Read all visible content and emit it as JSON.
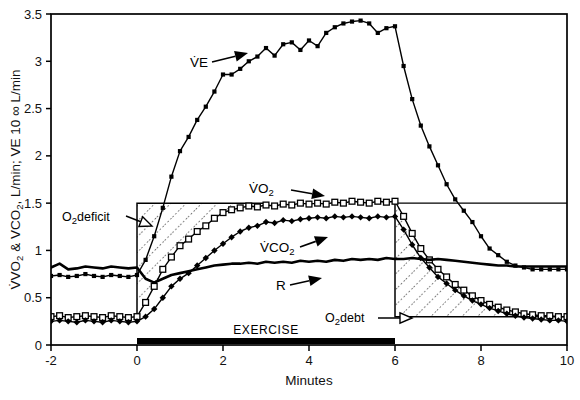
{
  "figure": {
    "yaxis_label_parts": {
      "p1": "VO",
      "p1sub": "2",
      "p2": " & VCO",
      "p2sub": "2",
      "p3": ", L/min; VE 10 ∞ L/min"
    },
    "yaxis_label": "VO2 & VCO2, L/min; VE 10 ∞ L/min",
    "xaxis_label": "Minutes",
    "exercise_bar_label": "EXERCISE"
  },
  "annotations": {
    "o2deficit": {
      "main": "O",
      "sub": "2",
      "tail": "deficit"
    },
    "o2debt": {
      "main": "O",
      "sub": "2",
      "tail": "debt"
    }
  },
  "series_labels": {
    "ve": "VE",
    "vo2": {
      "main": "VO",
      "sub": "2"
    },
    "vco2": {
      "main": "VCO",
      "sub": "2"
    },
    "r": "R"
  },
  "colors": {
    "ink": "#000000",
    "background": "#ffffff",
    "exercise_bar": "#000000"
  },
  "chart_data": {
    "type": "line",
    "title": "",
    "xlabel": "Minutes",
    "ylabel": "VO2 & VCO2, L/min; VE 10 ∞ L/min",
    "xlim": [
      -2,
      10
    ],
    "ylim": [
      0,
      3.5
    ],
    "xticks": [
      -2,
      0,
      2,
      4,
      6,
      8,
      10
    ],
    "yticks": [
      0,
      0.5,
      1,
      1.5,
      2,
      2.5,
      3,
      3.5
    ],
    "grid": false,
    "legend": "inline-annotations",
    "exercise_period": [
      0,
      6
    ],
    "shaded_regions": [
      {
        "name": "O2 deficit",
        "x": [
          0,
          3.0
        ],
        "y": [
          0.3,
          1.5
        ],
        "hatch": "dotted-diagonal",
        "description": "Area between the VO2 steady-state level (1.5) and the rising VO2 curve during the first ~3 minutes of exercise"
      },
      {
        "name": "O2 debt",
        "x": [
          6,
          10
        ],
        "y": [
          0.3,
          1.5
        ],
        "hatch": "dotted-diagonal",
        "description": "Area between the decaying VO2 curve after exercise and the resting baseline (0.3)"
      }
    ],
    "series": [
      {
        "name": "VE",
        "marker": "filled-square",
        "x": [
          -2.0,
          -1.8,
          -1.6,
          -1.4,
          -1.2,
          -1.0,
          -0.8,
          -0.6,
          -0.4,
          -0.2,
          0.0,
          0.2,
          0.4,
          0.6,
          0.8,
          1.0,
          1.2,
          1.4,
          1.6,
          1.8,
          2.0,
          2.2,
          2.4,
          2.6,
          2.8,
          3.0,
          3.2,
          3.4,
          3.6,
          3.8,
          4.0,
          4.2,
          4.4,
          4.6,
          4.8,
          5.0,
          5.2,
          5.4,
          5.6,
          5.8,
          6.0,
          6.2,
          6.4,
          6.6,
          6.8,
          7.0,
          7.2,
          7.4,
          7.6,
          7.8,
          8.0,
          8.2,
          8.4,
          8.6,
          8.8,
          9.0,
          9.2,
          9.4,
          9.6,
          9.8,
          10.0
        ],
        "y": [
          0.73,
          0.74,
          0.72,
          0.73,
          0.75,
          0.73,
          0.72,
          0.74,
          0.73,
          0.72,
          0.74,
          0.9,
          1.15,
          1.45,
          1.78,
          2.05,
          2.2,
          2.38,
          2.52,
          2.68,
          2.86,
          2.86,
          2.92,
          3.0,
          3.05,
          3.14,
          3.06,
          3.18,
          3.2,
          3.12,
          3.22,
          3.16,
          3.3,
          3.36,
          3.4,
          3.42,
          3.43,
          3.4,
          3.3,
          3.35,
          3.37,
          2.95,
          2.6,
          2.32,
          2.1,
          1.9,
          1.7,
          1.54,
          1.42,
          1.3,
          1.15,
          1.02,
          0.95,
          0.88,
          0.84,
          0.82,
          0.8,
          0.8,
          0.8,
          0.8,
          0.8
        ]
      },
      {
        "name": "VO2",
        "marker": "open-square",
        "x": [
          -2.0,
          -1.8,
          -1.6,
          -1.4,
          -1.2,
          -1.0,
          -0.8,
          -0.6,
          -0.4,
          -0.2,
          0.0,
          0.2,
          0.4,
          0.6,
          0.8,
          1.0,
          1.2,
          1.4,
          1.6,
          1.8,
          2.0,
          2.2,
          2.4,
          2.6,
          2.8,
          3.0,
          3.2,
          3.4,
          3.6,
          3.8,
          4.0,
          4.2,
          4.4,
          4.6,
          4.8,
          5.0,
          5.2,
          5.4,
          5.6,
          5.8,
          6.0,
          6.2,
          6.4,
          6.6,
          6.8,
          7.0,
          7.2,
          7.4,
          7.6,
          7.8,
          8.0,
          8.2,
          8.4,
          8.6,
          8.8,
          9.0,
          9.2,
          9.4,
          9.6,
          9.8,
          10.0
        ],
        "y": [
          0.3,
          0.31,
          0.29,
          0.3,
          0.31,
          0.3,
          0.29,
          0.31,
          0.3,
          0.29,
          0.3,
          0.45,
          0.62,
          0.8,
          0.93,
          1.05,
          1.12,
          1.2,
          1.26,
          1.34,
          1.4,
          1.43,
          1.45,
          1.47,
          1.46,
          1.48,
          1.47,
          1.49,
          1.48,
          1.5,
          1.49,
          1.5,
          1.49,
          1.51,
          1.5,
          1.52,
          1.51,
          1.5,
          1.52,
          1.51,
          1.52,
          1.36,
          1.18,
          1.02,
          0.9,
          0.8,
          0.72,
          0.64,
          0.58,
          0.52,
          0.47,
          0.43,
          0.4,
          0.37,
          0.35,
          0.33,
          0.32,
          0.31,
          0.31,
          0.3,
          0.3
        ]
      },
      {
        "name": "VCO2",
        "marker": "filled-diamond",
        "x": [
          -2.0,
          -1.8,
          -1.6,
          -1.4,
          -1.2,
          -1.0,
          -0.8,
          -0.6,
          -0.4,
          -0.2,
          0.0,
          0.2,
          0.4,
          0.6,
          0.8,
          1.0,
          1.2,
          1.4,
          1.6,
          1.8,
          2.0,
          2.2,
          2.4,
          2.6,
          2.8,
          3.0,
          3.2,
          3.4,
          3.6,
          3.8,
          4.0,
          4.2,
          4.4,
          4.6,
          4.8,
          5.0,
          5.2,
          5.4,
          5.6,
          5.8,
          6.0,
          6.2,
          6.4,
          6.6,
          6.8,
          7.0,
          7.2,
          7.4,
          7.6,
          7.8,
          8.0,
          8.2,
          8.4,
          8.6,
          8.8,
          9.0,
          9.2,
          9.4,
          9.6,
          9.8,
          10.0
        ],
        "y": [
          0.25,
          0.26,
          0.25,
          0.24,
          0.26,
          0.25,
          0.24,
          0.26,
          0.25,
          0.24,
          0.25,
          0.3,
          0.38,
          0.5,
          0.62,
          0.7,
          0.76,
          0.84,
          0.92,
          1.0,
          1.07,
          1.14,
          1.2,
          1.24,
          1.26,
          1.3,
          1.29,
          1.32,
          1.31,
          1.33,
          1.34,
          1.35,
          1.34,
          1.36,
          1.35,
          1.36,
          1.35,
          1.34,
          1.36,
          1.35,
          1.36,
          1.22,
          1.06,
          0.92,
          0.82,
          0.72,
          0.65,
          0.58,
          0.52,
          0.47,
          0.43,
          0.39,
          0.36,
          0.33,
          0.31,
          0.29,
          0.28,
          0.27,
          0.26,
          0.26,
          0.25
        ]
      },
      {
        "name": "R",
        "marker": "none",
        "x": [
          -2.0,
          -1.8,
          -1.6,
          -1.4,
          -1.2,
          -1.0,
          -0.8,
          -0.6,
          -0.4,
          -0.2,
          0.0,
          0.2,
          0.4,
          0.6,
          0.8,
          1.0,
          1.2,
          1.4,
          1.6,
          1.8,
          2.0,
          2.2,
          2.4,
          2.6,
          2.8,
          3.0,
          3.2,
          3.4,
          3.6,
          3.8,
          4.0,
          4.2,
          4.4,
          4.6,
          4.8,
          5.0,
          5.2,
          5.4,
          5.6,
          5.8,
          6.0,
          6.2,
          6.4,
          6.6,
          6.8,
          7.0,
          7.2,
          7.4,
          7.6,
          7.8,
          8.0,
          8.2,
          8.4,
          8.6,
          8.8,
          9.0,
          9.2,
          9.4,
          9.6,
          9.8,
          10.0
        ],
        "y": [
          0.82,
          0.86,
          0.8,
          0.81,
          0.83,
          0.82,
          0.81,
          0.83,
          0.82,
          0.81,
          0.82,
          0.7,
          0.66,
          0.7,
          0.74,
          0.76,
          0.78,
          0.8,
          0.82,
          0.84,
          0.85,
          0.86,
          0.86,
          0.87,
          0.86,
          0.88,
          0.87,
          0.88,
          0.87,
          0.89,
          0.88,
          0.89,
          0.88,
          0.9,
          0.89,
          0.91,
          0.9,
          0.91,
          0.9,
          0.92,
          0.91,
          0.91,
          0.92,
          0.91,
          0.9,
          0.91,
          0.9,
          0.89,
          0.88,
          0.87,
          0.86,
          0.85,
          0.84,
          0.84,
          0.83,
          0.83,
          0.83,
          0.83,
          0.83,
          0.83,
          0.83
        ]
      }
    ]
  }
}
